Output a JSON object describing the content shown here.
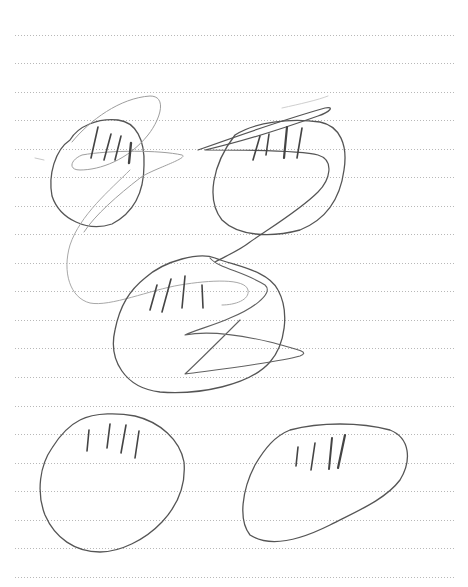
{
  "paper": {
    "type": "lined-notebook-page",
    "background": "#ffffff",
    "rule_color": "#b8b8b8",
    "rule_style": "dotted",
    "rule_x_start": 15,
    "rule_x_end": 455,
    "rule_y_positions": [
      35,
      63,
      92,
      120,
      149,
      177,
      206,
      234,
      263,
      291,
      320,
      348,
      377,
      406,
      434,
      463,
      491,
      520,
      548,
      577
    ]
  },
  "sketch": {
    "description": "Pencil drawing of five rounded shapes, each with four short vertical tally strokes near the top, connected by loose scribbled zig-zag lines",
    "stroke_color_dark": "#555555",
    "stroke_color_light": "#9a9a9a",
    "shapes": [
      {
        "name": "top-left-blob",
        "tally_count": 4
      },
      {
        "name": "top-right-blob",
        "tally_count": 4
      },
      {
        "name": "middle-blob",
        "tally_count": 4
      },
      {
        "name": "bottom-left-blob",
        "tally_count": 4
      },
      {
        "name": "bottom-right-blob",
        "tally_count": 4
      }
    ]
  }
}
